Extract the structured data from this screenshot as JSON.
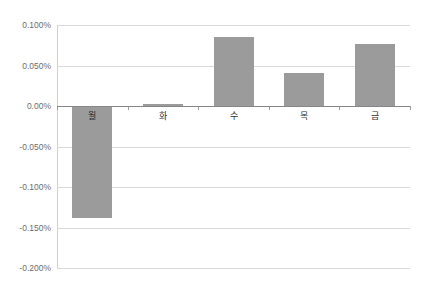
{
  "chart_data": {
    "type": "bar",
    "title": "",
    "subtitle": "",
    "xlabel": "",
    "ylabel": "",
    "categories": [
      "월",
      "화",
      "수",
      "목",
      "금"
    ],
    "values": [
      -0.138,
      0.003,
      0.085,
      0.041,
      0.077
    ],
    "value_unit": "%",
    "series": [
      {
        "name": "",
        "values": [
          -0.138,
          0.003,
          0.085,
          0.041,
          0.077
        ]
      }
    ],
    "ylim": [
      -0.2,
      0.1
    ],
    "ytick_values": [
      0.1,
      0.05,
      0.0,
      -0.05,
      -0.1,
      -0.15,
      -0.2
    ],
    "ytick_labels": [
      "0.100%",
      "0.050%",
      "0.00%",
      "-0.050%",
      "-0.100%",
      "-0.150%",
      "-0.200%"
    ],
    "ytick_step": 0.05,
    "grid": true,
    "grid_axis": "y",
    "legend": false,
    "legend_position": "none",
    "bar_color": "#9b9b9b",
    "gridline_color": "#d9d9d9",
    "axis_color": "#868686",
    "tick_label_color": "#6d6d6d",
    "category_label_color": "#2f2f2f",
    "background_color": "#ffffff",
    "annotations": []
  },
  "axis": {
    "y_labels": [
      "0.100%",
      "0.050%",
      "0.00%",
      "-0.050%",
      "-0.100%",
      "-0.150%",
      "-0.200%"
    ],
    "x_labels": [
      "월",
      "화",
      "수",
      "목",
      "금"
    ]
  }
}
